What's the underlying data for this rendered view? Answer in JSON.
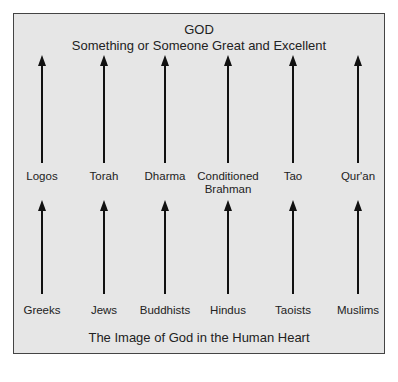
{
  "diagram": {
    "title": "GOD",
    "subtitle": "Something or Someone Great and Excellent",
    "caption": "The Image of God in the Human Heart",
    "columns": [
      {
        "x": 42,
        "middle_label": "Logos",
        "bottom_label": "Greeks"
      },
      {
        "x": 104,
        "middle_label": "Torah",
        "bottom_label": "Jews"
      },
      {
        "x": 165,
        "middle_label": "Dharma",
        "bottom_label": "Buddhists"
      },
      {
        "x": 228,
        "middle_label": "Conditioned Brahman",
        "bottom_label": "Hindus"
      },
      {
        "x": 293,
        "middle_label": "Tao",
        "bottom_label": "Taoists"
      },
      {
        "x": 358,
        "middle_label": "Qur'an",
        "bottom_label": "Muslims"
      }
    ],
    "colors": {
      "frame_fill": "#e6e6e6",
      "frame_border": "#444444",
      "arrow": "#111111",
      "text": "#222222"
    }
  }
}
